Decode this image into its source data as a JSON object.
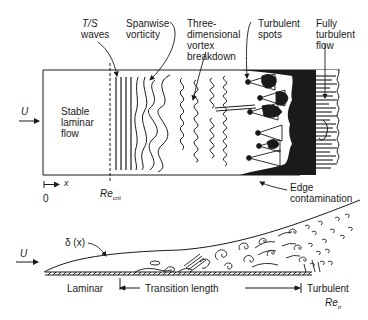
{
  "top_diagram": {
    "title": "Plan view of transition on a flat plate",
    "labels": {
      "ts_waves_line1": "T/S",
      "ts_waves_line2": "waves",
      "spanwise_line1": "Spanwise",
      "spanwise_line2": "vorticity",
      "three_d_line1": "Three-",
      "three_d_line2": "dimensional",
      "three_d_line3": "vortex",
      "three_d_line4": "breakdown",
      "spots_line1": "Turbulent",
      "spots_line2": "spots",
      "fully_line1": "Fully",
      "fully_line2": "turbulent",
      "fully_line3": "flow",
      "stable_line1": "Stable",
      "stable_line2": "laminar",
      "stable_line3": "flow",
      "freestream": "U",
      "x_axis": "x",
      "origin": "0",
      "re_crit_main": "Re",
      "re_crit_sub": "crit",
      "edge_line1": "Edge",
      "edge_line2": "contamination"
    }
  },
  "bottom_diagram": {
    "title": "Side view of boundary layer growth",
    "labels": {
      "freestream": "U",
      "delta": "δ (x)",
      "laminar": "Laminar",
      "transition_length": "Transition length",
      "turbulent": "Turbulent",
      "re_tr_main": "Re",
      "re_tr_sub": "tr"
    }
  },
  "colors": {
    "ink": "#1a1a1a",
    "background": "#ffffff"
  }
}
